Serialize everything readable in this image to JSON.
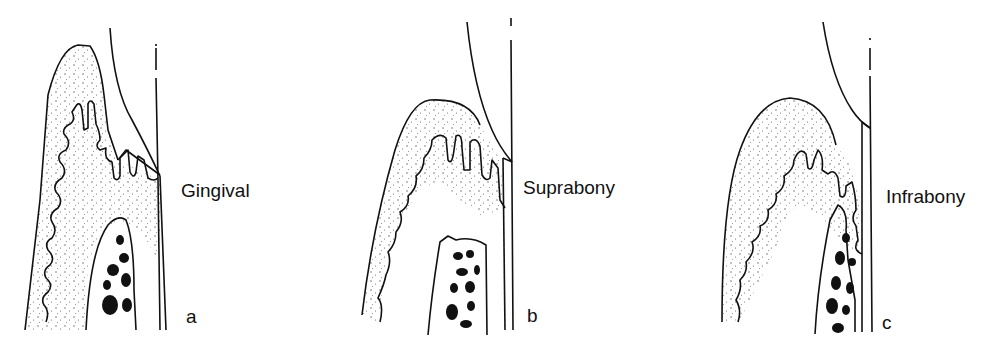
{
  "figure": {
    "panels": [
      {
        "id": "a",
        "letter": "a",
        "label": "Gingival"
      },
      {
        "id": "b",
        "letter": "b",
        "label": "Suprabony"
      },
      {
        "id": "c",
        "letter": "c",
        "label": "Infrabony"
      }
    ]
  },
  "colors": {
    "ink": "#111111",
    "background": "#ffffff",
    "stipple": "#555555"
  }
}
